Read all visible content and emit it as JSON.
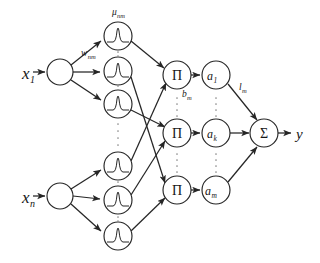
{
  "diagram": {
    "type": "neural-network-diagram",
    "background_color": "#ffffff",
    "stroke_color": "#262626",
    "dots_color": "#8a8a8a"
  },
  "inputs": [
    {
      "id": "x1",
      "base": "x",
      "sub": "1",
      "label": "x₁",
      "cx": 60,
      "cy": 72
    },
    {
      "id": "xn",
      "base": "x",
      "sub": "n",
      "label": "xₙ",
      "cx": 60,
      "cy": 196
    }
  ],
  "input_nodes": [
    {
      "id": "in1",
      "cx": 60,
      "cy": 72,
      "r": 13
    },
    {
      "id": "inn",
      "cx": 60,
      "cy": 196,
      "r": 13
    }
  ],
  "membership_nodes": [
    {
      "id": "mf11",
      "cx": 118,
      "cy": 36,
      "r": 14,
      "icon": "gaussian-bump-icon"
    },
    {
      "id": "mf12",
      "cx": 118,
      "cy": 71,
      "r": 14,
      "icon": "gaussian-bump-icon"
    },
    {
      "id": "mf13",
      "cx": 118,
      "cy": 104,
      "r": 14,
      "icon": "gaussian-bump-icon"
    },
    {
      "id": "mfn1",
      "cx": 118,
      "cy": 166,
      "r": 14,
      "icon": "gaussian-bump-icon"
    },
    {
      "id": "mfn2",
      "cx": 118,
      "cy": 200,
      "r": 14,
      "icon": "gaussian-bump-icon"
    },
    {
      "id": "mfn3",
      "cx": 118,
      "cy": 236,
      "r": 14,
      "icon": "gaussian-bump-icon"
    }
  ],
  "rule_nodes": [
    {
      "id": "prod1",
      "symbol": "Π",
      "cx": 177,
      "cy": 75,
      "r": 14
    },
    {
      "id": "prod2",
      "symbol": "Π",
      "cx": 177,
      "cy": 133,
      "r": 14
    },
    {
      "id": "prod3",
      "symbol": "Π",
      "cx": 177,
      "cy": 190,
      "r": 14
    }
  ],
  "norm_nodes": [
    {
      "id": "a1",
      "base": "a",
      "sub": "1",
      "label": "a₁",
      "cx": 216,
      "cy": 75,
      "r": 14
    },
    {
      "id": "ak",
      "base": "a",
      "sub": "k",
      "label": "aₖ",
      "cx": 216,
      "cy": 133,
      "r": 14
    },
    {
      "id": "am",
      "base": "a",
      "sub": "m",
      "label": "aₘ",
      "cx": 216,
      "cy": 190,
      "r": 14
    }
  ],
  "sum_node": {
    "id": "sum",
    "symbol": "Σ",
    "cx": 264,
    "cy": 133,
    "r": 14
  },
  "output": {
    "id": "y",
    "label": "y",
    "x": 300,
    "y": 133
  },
  "edge_labels": [
    {
      "id": "mu_nm",
      "base": "μ",
      "sub": "nm",
      "x": 120,
      "y": 14,
      "anchor": "middle"
    },
    {
      "id": "w_nm",
      "base": "w",
      "sub": "nm",
      "x": 90,
      "y": 54,
      "anchor": "middle"
    },
    {
      "id": "b_m",
      "base": "b",
      "sub": "m",
      "x": 187,
      "y": 95,
      "anchor": "start"
    },
    {
      "id": "l_m",
      "base": "l",
      "sub": "m",
      "x": 241,
      "y": 88,
      "anchor": "start"
    }
  ],
  "dot_columns": [
    {
      "id": "dots-mf-a",
      "cx": 118,
      "cy": 54,
      "count": 2
    },
    {
      "id": "dots-mf-b",
      "cx": 118,
      "cy": 88,
      "count": 2
    },
    {
      "id": "dots-mf-mid",
      "cx": 118,
      "cy": 134,
      "count": 4
    },
    {
      "id": "dots-mf-c",
      "cx": 118,
      "cy": 184,
      "count": 2
    },
    {
      "id": "dots-mf-d",
      "cx": 118,
      "cy": 219,
      "count": 2
    },
    {
      "id": "dots-prod-1",
      "cx": 177,
      "cy": 104,
      "count": 4
    },
    {
      "id": "dots-prod-2",
      "cx": 177,
      "cy": 162,
      "count": 4
    },
    {
      "id": "dots-norm-1",
      "cx": 216,
      "cy": 104,
      "count": 4
    },
    {
      "id": "dots-norm-2",
      "cx": 216,
      "cy": 162,
      "count": 4
    }
  ]
}
